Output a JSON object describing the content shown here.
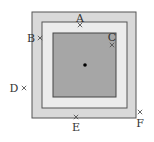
{
  "diagram": {
    "squares": [
      {
        "name": "outer",
        "x": 32,
        "y": 12,
        "w": 104,
        "h": 106,
        "fill": "#d9d9d9",
        "stroke": "#555555"
      },
      {
        "name": "middle",
        "x": 42,
        "y": 22,
        "w": 85,
        "h": 86,
        "fill": "#ececec",
        "stroke": "#555555"
      },
      {
        "name": "inner",
        "x": 53,
        "y": 33,
        "w": 63,
        "h": 64,
        "fill": "#a6a6a6",
        "stroke": "#444444"
      }
    ],
    "center": {
      "x": 85,
      "y": 65
    },
    "points": [
      {
        "label": "A",
        "mx": 80,
        "my": 25,
        "lx": 80,
        "ly": 22
      },
      {
        "label": "B",
        "mx": 40,
        "my": 38,
        "lx": 31,
        "ly": 42
      },
      {
        "label": "C",
        "mx": 112,
        "my": 45,
        "lx": 112,
        "ly": 41
      },
      {
        "label": "D",
        "mx": 24,
        "my": 88,
        "lx": 14,
        "ly": 92
      },
      {
        "label": "E",
        "mx": 76,
        "my": 117,
        "lx": 76,
        "ly": 131
      },
      {
        "label": "F",
        "mx": 140,
        "my": 112,
        "lx": 140,
        "ly": 127
      }
    ]
  }
}
